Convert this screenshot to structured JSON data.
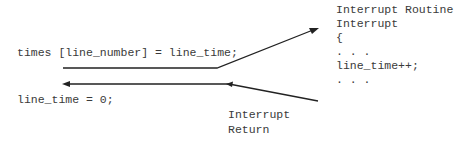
{
  "diagram": {
    "main_code": {
      "statement_before_interrupt": "times [line_number] = line_time;",
      "statement_after_return": "line_time = 0;"
    },
    "interrupt_routine": {
      "title": "Interrupt Routine",
      "lines": [
        "Interrupt",
        "{",
        ". . .",
        "line_time++;",
        ". . ."
      ]
    },
    "return_label": {
      "line1": "Interrupt",
      "line2": "Return"
    },
    "arrows": [
      {
        "name": "call-arrow",
        "from": "main_code",
        "to": "interrupt_routine",
        "direction": "right-up"
      },
      {
        "name": "return-arrow",
        "from": "interrupt_routine",
        "to": "main_code",
        "direction": "left"
      }
    ],
    "colors": {
      "text": "#3a3a3a",
      "line": "#222222",
      "background": "#ffffff"
    }
  }
}
